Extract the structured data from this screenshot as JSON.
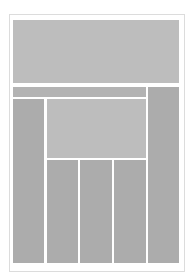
{
  "wireframe": {
    "colors": {
      "background": "#ffffff",
      "frame_border": "#dcdcdc",
      "block_dark": "#acacac",
      "block_mid": "#b3b3b3",
      "block_light": "#bdbdbd"
    },
    "regions": [
      {
        "name": "header",
        "x": 13,
        "y": 20,
        "w": 166,
        "h": 63
      },
      {
        "name": "nav-bar",
        "x": 13,
        "y": 87,
        "w": 133,
        "h": 10
      },
      {
        "name": "right-sidebar",
        "x": 148,
        "y": 87,
        "w": 31,
        "h": 176
      },
      {
        "name": "left-sidebar",
        "x": 13,
        "y": 99,
        "w": 31,
        "h": 164
      },
      {
        "name": "feature-area",
        "x": 47,
        "y": 99,
        "w": 99,
        "h": 59
      },
      {
        "name": "content-column-1",
        "x": 47,
        "y": 160,
        "w": 31,
        "h": 103
      },
      {
        "name": "content-column-2",
        "x": 80,
        "y": 160,
        "w": 32,
        "h": 103
      },
      {
        "name": "content-column-3",
        "x": 114,
        "y": 160,
        "w": 32,
        "h": 103
      }
    ]
  }
}
